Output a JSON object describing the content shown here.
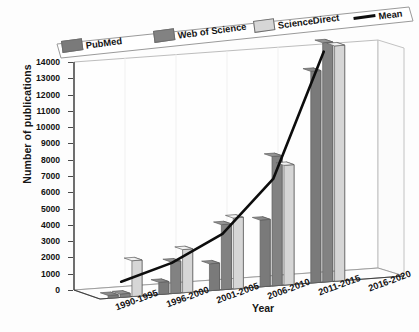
{
  "chart_data": {
    "type": "bar",
    "title": "",
    "xlabel": "Year",
    "ylabel": "Number of publications",
    "categories": [
      "1990-1995",
      "1996-2000",
      "2001-2005",
      "2006-2010",
      "2011-2015",
      "2016-2020"
    ],
    "ylim": [
      0,
      14000
    ],
    "ytick_step": 1000,
    "yticks": [
      "0",
      "1000",
      "2000",
      "3000",
      "4000",
      "5000",
      "6000",
      "7000",
      "8000",
      "9000",
      "10000",
      "11000",
      "12000",
      "13000",
      "14000"
    ],
    "grid": false,
    "projection": "3d",
    "legend_position": "top",
    "series": [
      {
        "name": "PubMed",
        "color": "#7a7a7a",
        "values": [
          180,
          750,
          1650,
          4100,
          13000,
          0
        ]
      },
      {
        "name": "Web of Science",
        "color": "#828282",
        "values": [
          210,
          1950,
          4000,
          7950,
          14700,
          0
        ]
      },
      {
        "name": "ScienceDirect",
        "color": "#d6d6d6",
        "values": [
          2200,
          2650,
          4350,
          7350,
          14450,
          0
        ]
      }
    ],
    "mean": {
      "name": "Mean",
      "color": "#0d0d0d",
      "values": [
        860,
        1780,
        3330,
        6470,
        14050,
        null
      ]
    },
    "annotations": []
  },
  "legend": {
    "items": [
      {
        "label": "PubMed",
        "marker": "swatch",
        "color": "#7a7a7a"
      },
      {
        "label": "Web of Science",
        "marker": "swatch",
        "color": "#828282"
      },
      {
        "label": "ScienceDirect",
        "marker": "swatch",
        "color": "#d6d6d6"
      },
      {
        "label": "Mean",
        "marker": "line",
        "color": "#0d0d0d"
      }
    ]
  },
  "colors": {
    "background": "#ffffff",
    "axis": "#4a4a4a",
    "text": "#141414",
    "pubmed": "#7a7a7a",
    "web_of_science": "#828282",
    "sciencedirect": "#d6d6d6",
    "mean_line": "#0d0d0d"
  }
}
